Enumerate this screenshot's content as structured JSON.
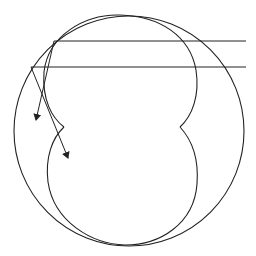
{
  "diagram": {
    "title": "",
    "stroke_color": "#222222",
    "background": "#ffffff",
    "mirror_circle": {
      "cx": 129,
      "cy": 131,
      "r": 115
    },
    "caustic": {
      "cusps": [
        {
          "x": 64,
          "y": 127
        },
        {
          "x": 180,
          "y": 127
        }
      ],
      "top": {
        "x": 120,
        "y": 16
      },
      "bottom": {
        "x": 125,
        "y": 245
      }
    },
    "rays": [
      {
        "incoming_y": 41,
        "start_x": 246,
        "reflect_point": {
          "x": 54,
          "y": 41
        },
        "arrow_tip": {
          "x": 36,
          "y": 120
        }
      },
      {
        "incoming_y": 67,
        "start_x": 246,
        "reflect_point": {
          "x": 31,
          "y": 67
        },
        "arrow_tip": {
          "x": 68,
          "y": 158
        }
      }
    ]
  }
}
